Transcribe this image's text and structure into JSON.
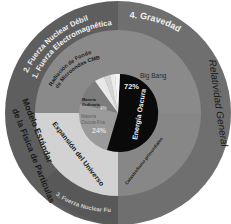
{
  "colors": {
    "background": "#ffffff",
    "outer_left": "#5e5e5e",
    "outer_right": "#6f6f6f",
    "outer_bottom_band": "#585858",
    "middle_top": "#8a8a8a",
    "middle_bottom_left": "#d2d2d2",
    "middle_bottom_right": "#878787",
    "pie_dark_energy": "#0a0a0a",
    "pie_dark_matter": "#9a9a9a",
    "pie_ordinary": "#7c7c7c",
    "pie_light_slices": "#e8e8e8",
    "text_light": "#f0f0f0",
    "text_dark": "#1a1a1a"
  },
  "outer_ring": {
    "top_left_label_1": "2. Fuerza Nuclear Débil",
    "top_left_label_2": "1. Fuerza Electromagnética",
    "top_right_label": "4. Gravedad",
    "right_label": "Relatividad General",
    "left_label_1": "Modelo Estándar",
    "left_label_2": "de la Física de Partículas",
    "bottom_label": "3. Fuerza Nuclear Fuerte"
  },
  "middle_ring": {
    "top_left_label_1": "Radiación de Fondo",
    "top_left_label_2": "de Microondas CMB",
    "top_right_label": "Big Bang",
    "bottom_left_label": "Expansión del Universo",
    "bottom_right_label": "Catastrofismo primordiales"
  },
  "inner_pie": {
    "dark_energy_label": "Energía Oscura",
    "dark_energy_value": "72%",
    "dark_matter_label_1": "Materia",
    "dark_matter_label_2": "Oscura Fría",
    "dark_matter_value": "24%",
    "ordinary_label_1": "Materia",
    "ordinary_label_2": "Ordinaria",
    "ordinary_value": "4%"
  }
}
